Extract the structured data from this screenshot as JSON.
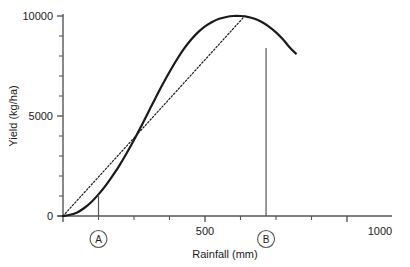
{
  "chart_data": {
    "type": "line",
    "title": "",
    "xlabel": "Rainfall (mm)",
    "ylabel": "Yield (kg/ha)",
    "xlim": [
      0,
      1000
    ],
    "ylim": [
      0,
      10000
    ],
    "grid": false,
    "legend": null,
    "x_ticks": [
      0,
      500,
      1000
    ],
    "x_tick_labels": [
      "",
      "500",
      "1000"
    ],
    "x_minor_ticks": [
      125,
      250,
      375,
      625,
      750,
      875
    ],
    "y_ticks": [
      0,
      5000,
      10000
    ],
    "y_tick_labels": [
      "0",
      "5000",
      "10000"
    ],
    "y_minor_ticks": [
      1000,
      2000,
      3000,
      4000,
      6000,
      7000,
      8000,
      9000
    ],
    "series": [
      {
        "name": "yield-response-curve",
        "style": "solid",
        "color": "#1a1a1a",
        "x": [
          0,
          25,
          50,
          75,
          100,
          125,
          150,
          175,
          200,
          225,
          250,
          275,
          300,
          325,
          350,
          375,
          400,
          425,
          450,
          475,
          500,
          525,
          550,
          575,
          600,
          625,
          650,
          675,
          700,
          725,
          750,
          775,
          800,
          820
        ],
        "y": [
          0,
          60,
          180,
          400,
          700,
          1080,
          1520,
          2020,
          2560,
          3160,
          3800,
          4480,
          5180,
          5880,
          6560,
          7200,
          7800,
          8340,
          8800,
          9180,
          9480,
          9700,
          9860,
          9950,
          10000,
          10000,
          9960,
          9860,
          9700,
          9470,
          9180,
          8820,
          8400,
          8120
        ]
      },
      {
        "name": "tangent-line-from-origin",
        "style": "dotted",
        "color": "#1a1a1a",
        "x": [
          0,
          640
        ],
        "y": [
          0,
          10000
        ]
      }
    ],
    "annotations": [
      {
        "name": "marker-A",
        "label": "A",
        "x": 125,
        "y_top": 1080,
        "description": "vertical drop line from curve to x-axis at point of maximum average product"
      },
      {
        "name": "marker-B",
        "label": "B",
        "x": 715,
        "y_top": 8400,
        "description": "vertical drop line from tangent line to x-axis"
      }
    ]
  },
  "axis": {
    "x_title": "Rainfall (mm)",
    "y_title": "Yield (kg/ha)",
    "x_label_500": "500",
    "x_label_1000": "1000",
    "y_label_0": "0",
    "y_label_5000": "5000",
    "y_label_10000": "10000"
  },
  "markers": {
    "a": "A",
    "b": "B"
  },
  "colors": {
    "axis": "#555555",
    "curve": "#1a1a1a",
    "tangent": "#333333",
    "text": "#1a1a1a",
    "background": "#ffffff"
  }
}
